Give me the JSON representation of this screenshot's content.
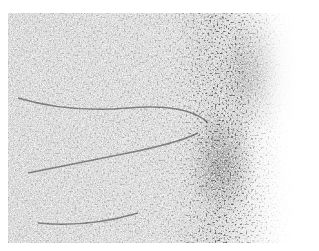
{
  "image": {
    "description": "Grayscale microscopy tissue texture with dense dark speckled region on right-center fading to white at right edge",
    "colors": {
      "background": "#ffffff",
      "tissue_light": "#d4d4d4",
      "speckle_dark": "#222222"
    }
  }
}
